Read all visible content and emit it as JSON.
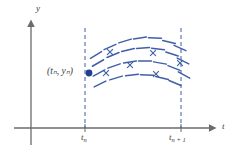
{
  "figure": {
    "width": 235,
    "height": 154,
    "background": "#ffffff"
  },
  "colors": {
    "axis": "#6b6b6b",
    "text": "#3a3a3a",
    "field": "#3f5fa8",
    "point": "#1f3f8f",
    "dashed_guide": "#3f5fa8"
  },
  "axes": {
    "y_label": "y",
    "t_label": "t",
    "origin": {
      "x": 31,
      "y": 128
    },
    "x_axis": {
      "x_start": 14,
      "x_end": 216,
      "y": 128,
      "arrow": "right"
    },
    "y_axis": {
      "y_start": 22,
      "y_end": 145,
      "x": 31,
      "arrow": "up"
    }
  },
  "ticks": [
    {
      "name": "t-n",
      "label_main": "t",
      "label_sub": "n",
      "x": 85,
      "y": 128
    },
    {
      "name": "t-n-plus-1",
      "label_main": "t",
      "label_sub": "n + 1",
      "x": 181,
      "y": 128
    }
  ],
  "guides": [
    {
      "name": "left-dashed-guide",
      "x": 85,
      "y_top": 28,
      "y_bottom": 128
    },
    {
      "name": "right-dashed-guide",
      "x": 181,
      "y_top": 28,
      "y_bottom": 128
    }
  ],
  "point": {
    "name": "initial-point",
    "label_main": "(t",
    "label_full": "(tₙ, yₙ)",
    "x": 89,
    "y": 73,
    "radius": 3.4
  },
  "chart_data": {
    "type": "scatter",
    "title": "",
    "xlabel": "t",
    "ylabel": "y",
    "xticks": [
      "t_n",
      "t_n+1"
    ],
    "xtick_positions": [
      85,
      181
    ],
    "grid": false,
    "legend": null,
    "slope_marks": [
      {
        "x": 96,
        "y": 55,
        "angle": -32,
        "len": 13
      },
      {
        "x": 110,
        "y": 47,
        "angle": -24,
        "len": 13
      },
      {
        "x": 125,
        "y": 41,
        "angle": -17,
        "len": 13
      },
      {
        "x": 140,
        "y": 38,
        "angle": -8,
        "len": 13
      },
      {
        "x": 155,
        "y": 38,
        "angle": 2,
        "len": 13
      },
      {
        "x": 169,
        "y": 42,
        "angle": 14,
        "len": 13
      },
      {
        "x": 180,
        "y": 48,
        "angle": 24,
        "len": 13
      },
      {
        "x": 98,
        "y": 63,
        "angle": -30,
        "len": 13
      },
      {
        "x": 113,
        "y": 55,
        "angle": -22,
        "len": 13
      },
      {
        "x": 128,
        "y": 50,
        "angle": -13,
        "len": 13
      },
      {
        "x": 143,
        "y": 48,
        "angle": -4,
        "len": 13
      },
      {
        "x": 158,
        "y": 49,
        "angle": 7,
        "len": 13
      },
      {
        "x": 172,
        "y": 54,
        "angle": 18,
        "len": 13
      },
      {
        "x": 183,
        "y": 61,
        "angle": 27,
        "len": 13
      },
      {
        "x": 99,
        "y": 73,
        "angle": -28,
        "len": 13
      },
      {
        "x": 114,
        "y": 66,
        "angle": -19,
        "len": 13
      },
      {
        "x": 130,
        "y": 62,
        "angle": -9,
        "len": 13
      },
      {
        "x": 145,
        "y": 61,
        "angle": 0,
        "len": 13
      },
      {
        "x": 160,
        "y": 63,
        "angle": 10,
        "len": 13
      },
      {
        "x": 174,
        "y": 68,
        "angle": 21,
        "len": 13
      },
      {
        "x": 184,
        "y": 75,
        "angle": 29,
        "len": 13
      },
      {
        "x": 100,
        "y": 84,
        "angle": -26,
        "len": 13
      },
      {
        "x": 116,
        "y": 78,
        "angle": -17,
        "len": 13
      },
      {
        "x": 132,
        "y": 75,
        "angle": -7,
        "len": 13
      },
      {
        "x": 147,
        "y": 75,
        "angle": 3,
        "len": 13
      },
      {
        "x": 162,
        "y": 78,
        "angle": 13,
        "len": 13
      },
      {
        "x": 175,
        "y": 83,
        "angle": 23,
        "len": 13
      }
    ],
    "x_markers": [
      {
        "x": 110,
        "y": 52
      },
      {
        "x": 153,
        "y": 53
      },
      {
        "x": 130,
        "y": 65
      },
      {
        "x": 180,
        "y": 63
      },
      {
        "x": 106,
        "y": 73
      },
      {
        "x": 156,
        "y": 74
      }
    ]
  }
}
